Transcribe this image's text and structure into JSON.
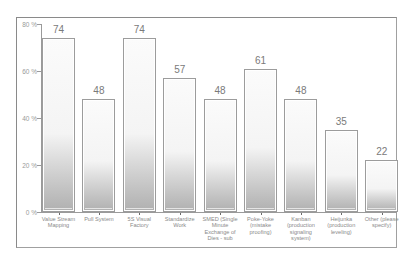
{
  "chart_data": {
    "type": "bar",
    "title": "",
    "xlabel": "",
    "ylabel": "",
    "ylim": [
      0,
      80
    ],
    "y_ticks": [
      "0 %",
      "20 %",
      "40 %",
      "60 %",
      "80 %"
    ],
    "y_tick_values": [
      0,
      20,
      40,
      60,
      80
    ],
    "grid": false,
    "legend": null,
    "categories": [
      "Value Stream Mapping",
      "Pull System",
      "5S Visual Factory",
      "Standardize Work",
      "SMED (Single Minute Exchange of Dies - sub",
      "Poke-Yoke (mistake proofing)",
      "Kanban (production signaling system)",
      "Heijunka (production leveling)",
      "Other (please specify)"
    ],
    "values": [
      74,
      48,
      74,
      57,
      48,
      61,
      48,
      35,
      22
    ],
    "value_labels": [
      "74",
      "48",
      "74",
      "57",
      "48",
      "61",
      "48",
      "35",
      "22"
    ],
    "colors": {
      "bar_top": "#fbfbfb",
      "bar_bottom": "#b0b0b0",
      "bar_border": "#9c9c9c",
      "value_text": "#7a7a7a",
      "axis": "#9a9a9a"
    }
  }
}
